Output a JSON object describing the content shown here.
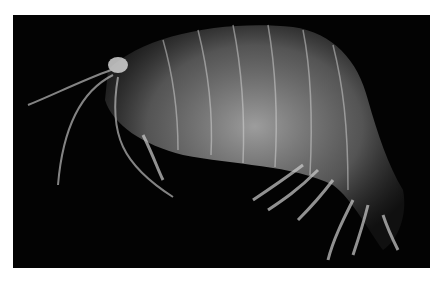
{
  "image": {
    "subject": "amphipod crustacean",
    "description": "Translucent amphipod on black background, side view facing left",
    "background_color": "#030303",
    "border_color": "#ffffff"
  }
}
